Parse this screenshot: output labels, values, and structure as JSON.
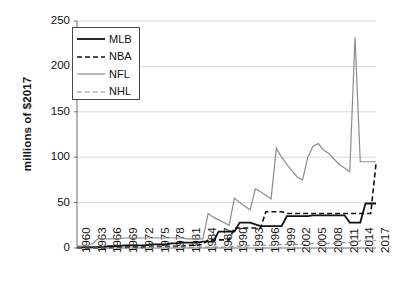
{
  "chart_data": {
    "type": "line",
    "title": "",
    "subtitle": "",
    "xlabel": "",
    "ylabel": "millions of $2017",
    "xlim": [
      1960,
      2017
    ],
    "ylim": [
      0,
      250
    ],
    "grid": true,
    "legend_position": "top-left",
    "y_ticks": [
      0,
      50,
      100,
      150,
      200,
      250
    ],
    "y_tick_labels": [
      "0",
      "50",
      "100",
      "150",
      "200",
      "250"
    ],
    "x_ticks": [
      1960,
      1963,
      1966,
      1969,
      1972,
      1975,
      1978,
      1981,
      1984,
      1987,
      1990,
      1993,
      1996,
      1999,
      2002,
      2005,
      2008,
      2011,
      2014,
      2017
    ],
    "x_tick_labels": [
      "1960",
      "1963",
      "1966",
      "1969",
      "1972",
      "1975",
      "1978",
      "1981",
      "1984",
      "1987",
      "1990",
      "1993",
      "1996",
      "1999",
      "2002",
      "2005",
      "2008",
      "2011",
      "2014",
      "2017"
    ],
    "x": [
      1960,
      1961,
      1962,
      1963,
      1964,
      1965,
      1966,
      1967,
      1968,
      1969,
      1970,
      1971,
      1972,
      1973,
      1974,
      1975,
      1976,
      1977,
      1978,
      1979,
      1980,
      1981,
      1982,
      1983,
      1984,
      1985,
      1986,
      1987,
      1988,
      1989,
      1990,
      1991,
      1992,
      1993,
      1994,
      1995,
      1996,
      1997,
      1998,
      1999,
      2000,
      2001,
      2002,
      2003,
      2004,
      2005,
      2006,
      2007,
      2008,
      2009,
      2010,
      2011,
      2012,
      2013,
      2014,
      2015,
      2016,
      2017
    ],
    "series": [
      {
        "name": "MLB",
        "color": "#111111",
        "style": "solid",
        "width": 1.8,
        "values": [
          1,
          1,
          1,
          1,
          1,
          1,
          2,
          2,
          2,
          3,
          3,
          3,
          3,
          3,
          4,
          4,
          4,
          4,
          5,
          5,
          6,
          6,
          6,
          6,
          7,
          7,
          7,
          18,
          18,
          18,
          18,
          28,
          28,
          28,
          26,
          24,
          24,
          24,
          24,
          24,
          35,
          35,
          35,
          35,
          35,
          36,
          36,
          36,
          36,
          36,
          36,
          36,
          28,
          28,
          28,
          49,
          49,
          49
        ]
      },
      {
        "name": "NBA",
        "color": "#111111",
        "style": "dashed",
        "width": 1.6,
        "values": [
          0,
          0,
          0,
          0,
          0,
          0,
          0,
          1,
          1,
          1,
          1,
          1,
          1,
          1,
          2,
          2,
          2,
          2,
          2,
          2,
          2,
          3,
          3,
          3,
          4,
          9,
          9,
          9,
          9,
          9,
          22,
          22,
          22,
          22,
          22,
          22,
          40,
          40,
          40,
          40,
          38,
          38,
          38,
          38,
          38,
          38,
          38,
          38,
          38,
          38,
          38,
          38,
          38,
          38,
          38,
          38,
          38,
          93
        ]
      },
      {
        "name": "NFL",
        "color": "#8c8c8c",
        "style": "solid",
        "width": 1.2,
        "values": [
          2,
          2,
          3,
          5,
          10,
          10,
          10,
          10,
          10,
          11,
          11,
          11,
          11,
          11,
          11,
          11,
          11,
          11,
          11,
          11,
          11,
          10,
          10,
          10,
          10,
          38,
          34,
          31,
          28,
          25,
          55,
          50,
          46,
          42,
          65,
          62,
          58,
          54,
          110,
          100,
          92,
          85,
          78,
          75,
          100,
          112,
          115,
          108,
          104,
          98,
          92,
          88,
          84,
          232,
          95,
          95,
          95,
          95
        ]
      },
      {
        "name": "NHL",
        "color": "#8c8c8c",
        "style": "dashed",
        "width": 1.2,
        "values": [
          0,
          0,
          0,
          0,
          0,
          0,
          0,
          0,
          0,
          0,
          0,
          0,
          0,
          0,
          1,
          1,
          1,
          1,
          1,
          1,
          1,
          1,
          1,
          1,
          1,
          1,
          1,
          1,
          1,
          1,
          2,
          2,
          2,
          3,
          3,
          3,
          3,
          3,
          3,
          4,
          4,
          4,
          4,
          4,
          4,
          5,
          5,
          5,
          5,
          5,
          6,
          6,
          6,
          6,
          8,
          8,
          8,
          8
        ]
      }
    ],
    "legend": [
      {
        "label": "MLB",
        "color": "#111111",
        "style": "solid",
        "width": 1.8
      },
      {
        "label": "NBA",
        "color": "#111111",
        "style": "dashed",
        "width": 1.6
      },
      {
        "label": "NFL",
        "color": "#8c8c8c",
        "style": "solid",
        "width": 1.2
      },
      {
        "label": "NHL",
        "color": "#8c8c8c",
        "style": "dashed",
        "width": 1.2
      }
    ]
  },
  "colors": {
    "axis": "#6f6f6f",
    "grid": "#d9d9d9",
    "text": "#111111",
    "background": "#ffffff",
    "legend_border": "#4a4a4a"
  }
}
